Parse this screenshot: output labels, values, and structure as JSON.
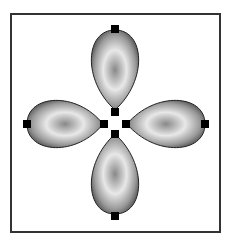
{
  "diagram": {
    "frame": {
      "x": 10,
      "y": 13,
      "width": 210,
      "height": 219,
      "stroke": "#333333"
    },
    "center": {
      "x": 115,
      "y": 122
    },
    "petal_colors": {
      "edge": "#555555",
      "mid": "#e8e8e8",
      "core": "#888888"
    },
    "marker_color": "#000000",
    "petals": [
      "top",
      "right",
      "bottom",
      "left"
    ]
  }
}
